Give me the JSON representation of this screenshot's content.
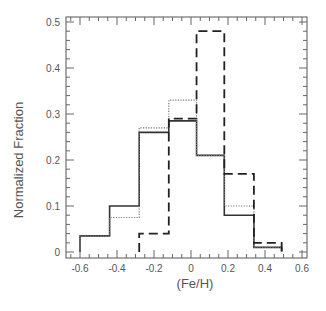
{
  "chart_data": {
    "type": "bar",
    "subtype": "step-histogram",
    "title": "",
    "xlabel": "(Fe/H)",
    "ylabel": "Normalized Fraction",
    "xlim": [
      -0.65,
      0.62
    ],
    "ylim": [
      0,
      0.51
    ],
    "x_ticks": [
      -0.6,
      -0.4,
      -0.2,
      0,
      0.2,
      0.4,
      0.6
    ],
    "x_tick_labels": [
      "-0.6",
      "-0.4",
      "-0.2",
      "0",
      "0.2",
      "0.4",
      "0.6"
    ],
    "y_ticks": [
      0,
      0.1,
      0.2,
      0.3,
      0.4,
      0.5
    ],
    "y_tick_labels": [
      "0",
      "0.1",
      "0.2",
      "0.3",
      "0.4",
      "0.5"
    ],
    "grid": false,
    "legend": null,
    "bin_edges": [
      -0.6,
      -0.44,
      -0.28,
      -0.12,
      0.03,
      0.18,
      0.34,
      0.49
    ],
    "series": [
      {
        "name": "solid",
        "line_style": "solid",
        "color": "#333333",
        "values": [
          0.035,
          0.1,
          0.26,
          0.285,
          0.21,
          0.08,
          0.01
        ]
      },
      {
        "name": "dotted",
        "line_style": "dotted",
        "color": "#777777",
        "values": [
          0.035,
          0.075,
          0.27,
          0.33,
          0.21,
          0.1,
          0.01
        ]
      },
      {
        "name": "dashed",
        "line_style": "dashed",
        "color": "#222222",
        "values": [
          0,
          0,
          0.04,
          0.29,
          0.48,
          0.17,
          0.02
        ]
      }
    ]
  }
}
